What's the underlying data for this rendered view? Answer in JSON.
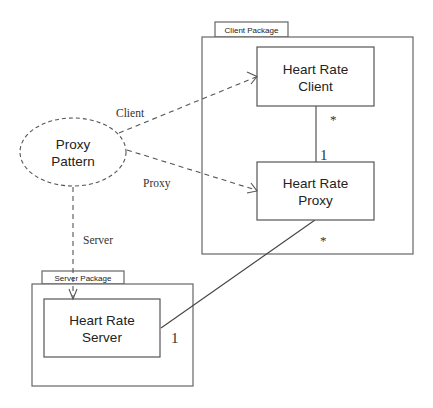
{
  "diagram": {
    "type": "UML package/class diagram",
    "collaboration": {
      "line1": "Proxy",
      "line2": "Pattern"
    },
    "packages": [
      {
        "tab_label": "Client Package",
        "classes": [
          {
            "line1": "Heart Rate",
            "line2": "Client"
          },
          {
            "line1": "Heart Rate",
            "line2": "Proxy"
          }
        ]
      },
      {
        "tab_label": "Server Package",
        "classes": [
          {
            "line1": "Heart Rate",
            "line2": "Server"
          }
        ]
      }
    ],
    "role_labels": {
      "client": "Client",
      "proxy": "Proxy",
      "server": "Server"
    },
    "multiplicities": {
      "client_end": "*",
      "proxy_end_to_client": "1",
      "proxy_end_to_server": "*",
      "server_end": "1"
    },
    "colors": {
      "line": "#555555",
      "text": "#222222",
      "background": "#ffffff"
    }
  }
}
